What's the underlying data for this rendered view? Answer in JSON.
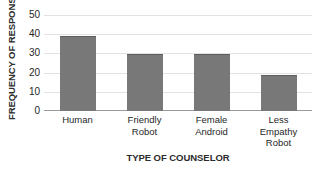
{
  "chart_data": {
    "type": "bar",
    "title": "",
    "xlabel": "TYPE OF COUNSELOR",
    "ylabel": "FREQUENCY OF RESPONSE",
    "categories": [
      "Human",
      "Friendly Robot",
      "Female Android",
      "Less Empathy Robot"
    ],
    "category_lines": [
      [
        "Human"
      ],
      [
        "Friendly",
        "Robot"
      ],
      [
        "Female",
        "Android"
      ],
      [
        "Less",
        "Empathy",
        "Robot"
      ]
    ],
    "values": [
      39,
      29.5,
      29.5,
      18.5
    ],
    "ylim": [
      0,
      50
    ],
    "ytick_values": [
      0,
      10,
      20,
      30,
      40,
      50
    ],
    "ytick_labels": [
      "0",
      "10",
      "20",
      "30",
      "40",
      "50"
    ],
    "grid": true,
    "legend": false,
    "legend_position": "none",
    "bar_color": "#787878",
    "bar_edge_color": "#5e5e5e",
    "gridline_color": "#e2e2e2",
    "axis_color": "#9a9a9a",
    "background_color": "#ffffff",
    "text_color": "#1f1f1f"
  }
}
